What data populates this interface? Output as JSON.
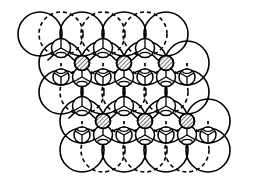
{
  "figure": {
    "name": "tetrahedral-close-packed-crystal-structure",
    "type": "crystal-structure-diagram",
    "width": 279,
    "height": 186,
    "background_color": "#ffffff",
    "stroke_color": "#000000",
    "hatch_color": "#000000"
  },
  "legend_semantics": {
    "large_solid_circle": "large anion sphere in upper close-packed layer",
    "large_dashed_circle": "large anion sphere in lower close-packed layer",
    "small_solid_circle": "small cation in tetrahedral site",
    "hatched_circle": "occupied interstitial cation site (hatched)",
    "solid_bond": "bond in plane of drawing",
    "dashed_bond": "bond receding behind plane"
  },
  "geometry": {
    "large_radius": 22,
    "medium_radius": 9.5,
    "small_radius": 6.5,
    "hatch_radius": 7.5,
    "column_spacing": 42,
    "row_spacing": 29,
    "row_offset_x": 21,
    "stroke_width_large": 1.6,
    "stroke_width_small": 1.5,
    "stroke_width_bond": 1.7,
    "dash_pattern_large": "4 3",
    "dash_pattern_bond": "3.2 2.6"
  },
  "chart_data": {
    "type": "scatter",
    "title": "",
    "xlabel": "",
    "ylabel": "",
    "xlim": [
      0,
      279
    ],
    "ylim": [
      0,
      186
    ],
    "grid": false,
    "legend": "none",
    "series": [
      {
        "name": "large-solid-spheres-row-1",
        "role": "large_solid_circle",
        "radius": 22,
        "points": [
          [
            40,
            34
          ],
          [
            82,
            34
          ],
          [
            124,
            34
          ],
          [
            166,
            34
          ]
        ]
      },
      {
        "name": "large-solid-spheres-row-2",
        "role": "large_solid_circle",
        "radius": 22,
        "points": [
          [
            61,
            92
          ],
          [
            103,
            92
          ],
          [
            145,
            92
          ],
          [
            187,
            92
          ]
        ]
      },
      {
        "name": "large-solid-spheres-row-3",
        "role": "large_solid_circle",
        "radius": 22,
        "points": [
          [
            82,
            150
          ],
          [
            124,
            150
          ],
          [
            166,
            150
          ],
          [
            208,
            150
          ]
        ]
      },
      {
        "name": "large-solid-spheres-interlayer-a",
        "role": "large_solid_circle",
        "radius": 22,
        "points": [
          [
            61,
            63
          ],
          [
            103,
            63
          ],
          [
            145,
            63
          ],
          [
            187,
            63
          ]
        ]
      },
      {
        "name": "large-solid-spheres-interlayer-b",
        "role": "large_solid_circle",
        "radius": 22,
        "points": [
          [
            82,
            121
          ],
          [
            124,
            121
          ],
          [
            166,
            121
          ],
          [
            208,
            121
          ]
        ]
      },
      {
        "name": "large-dashed-spheres-row-1",
        "role": "large_dashed_circle",
        "radius": 22,
        "points": [
          [
            61,
            34
          ],
          [
            103,
            34
          ],
          [
            145,
            34
          ]
        ]
      },
      {
        "name": "large-dashed-spheres-row-2",
        "role": "large_dashed_circle",
        "radius": 22,
        "points": [
          [
            82,
            92
          ],
          [
            124,
            92
          ],
          [
            166,
            92
          ]
        ]
      },
      {
        "name": "large-dashed-spheres-row-3",
        "role": "large_dashed_circle",
        "radius": 22,
        "points": [
          [
            103,
            150
          ],
          [
            145,
            150
          ],
          [
            187,
            150
          ]
        ]
      },
      {
        "name": "tetrahedral-cations-up",
        "role": "small_solid_circle_y_bonds",
        "radius": 9.5,
        "points": [
          [
            61,
            48
          ],
          [
            103,
            48
          ],
          [
            145,
            48
          ],
          [
            82,
            106
          ],
          [
            124,
            106
          ],
          [
            166,
            106
          ],
          [
            82,
            77
          ],
          [
            124,
            77
          ],
          [
            166,
            77
          ],
          [
            103,
            135
          ],
          [
            145,
            135
          ],
          [
            187,
            135
          ]
        ]
      },
      {
        "name": "tetrahedral-cations-down",
        "role": "small_solid_circle_inverted_bonds",
        "radius": 8,
        "points": [
          [
            61,
            77
          ],
          [
            103,
            77
          ],
          [
            145,
            77
          ],
          [
            187,
            77
          ],
          [
            82,
            135
          ],
          [
            124,
            135
          ],
          [
            166,
            135
          ],
          [
            208,
            135
          ]
        ]
      },
      {
        "name": "hatched-interstitials-row-1",
        "role": "hatched_circle",
        "radius": 7.5,
        "points": [
          [
            82,
            63
          ],
          [
            124,
            63
          ],
          [
            166,
            63
          ]
        ]
      },
      {
        "name": "hatched-interstitials-row-2",
        "role": "hatched_circle",
        "radius": 7.5,
        "points": [
          [
            103,
            121
          ],
          [
            145,
            121
          ],
          [
            187,
            121
          ]
        ]
      }
    ],
    "bond_sets": [
      {
        "name": "vertical-solid-bonds",
        "style": "solid",
        "segments": [
          [
            61,
            48,
            61,
            34
          ],
          [
            103,
            48,
            103,
            34
          ],
          [
            145,
            48,
            145,
            34
          ],
          [
            82,
            63,
            82,
            77
          ],
          [
            124,
            63,
            124,
            77
          ],
          [
            166,
            63,
            166,
            77
          ],
          [
            82,
            106,
            82,
            92
          ],
          [
            124,
            106,
            124,
            92
          ],
          [
            166,
            106,
            166,
            92
          ],
          [
            103,
            121,
            103,
            135
          ],
          [
            145,
            121,
            145,
            135
          ],
          [
            187,
            121,
            187,
            135
          ]
        ]
      },
      {
        "name": "diagonal-solid-bonds",
        "style": "solid",
        "segments": [
          [
            61,
            48,
            48,
            60
          ],
          [
            61,
            48,
            74,
            60
          ],
          [
            103,
            48,
            90,
            60
          ],
          [
            103,
            48,
            116,
            60
          ],
          [
            145,
            48,
            132,
            60
          ],
          [
            145,
            48,
            158,
            60
          ],
          [
            82,
            106,
            69,
            118
          ],
          [
            82,
            106,
            95,
            118
          ],
          [
            124,
            106,
            111,
            118
          ],
          [
            124,
            106,
            137,
            118
          ],
          [
            166,
            106,
            153,
            118
          ],
          [
            166,
            106,
            179,
            118
          ]
        ]
      },
      {
        "name": "dashed-receding-bonds",
        "style": "dashed",
        "segments": [
          [
            61,
            63,
            61,
            77
          ],
          [
            103,
            63,
            103,
            77
          ],
          [
            145,
            63,
            145,
            77
          ],
          [
            187,
            63,
            187,
            77
          ],
          [
            82,
            121,
            82,
            135
          ],
          [
            124,
            121,
            124,
            135
          ],
          [
            166,
            121,
            166,
            135
          ],
          [
            208,
            121,
            208,
            135
          ],
          [
            61,
            34,
            61,
            48
          ],
          [
            103,
            34,
            103,
            48
          ],
          [
            145,
            34,
            145,
            48
          ]
        ]
      }
    ]
  }
}
